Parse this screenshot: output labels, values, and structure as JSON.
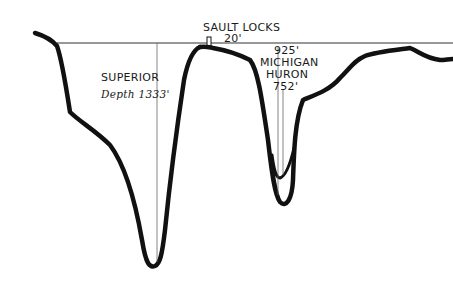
{
  "diagram": {
    "type": "cross-section profile",
    "colors": {
      "background": "#ffffff",
      "ink": "#111111",
      "reference_line": "#333333",
      "depth_line": "#666666"
    }
  },
  "labels": {
    "sault_locks": "SAULT LOCKS",
    "sault_locks_height": "20'",
    "superior_name": "SUPERIOR",
    "superior_depth": "Depth 1333'",
    "michigan_depth": "925'",
    "michigan_name": "MICHIGAN",
    "huron_name": "HURON",
    "huron_depth": "752'"
  },
  "lakes": [
    {
      "name": "SUPERIOR",
      "depth": "1333'"
    },
    {
      "name": "MICHIGAN",
      "depth": "925'"
    },
    {
      "name": "HURON",
      "depth": "752'"
    }
  ]
}
